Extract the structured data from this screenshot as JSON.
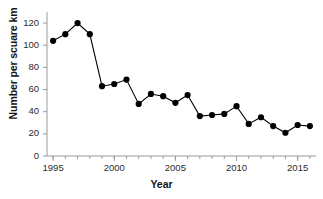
{
  "chart_data": {
    "type": "line",
    "title": "",
    "xlabel": "Year",
    "ylabel": "Number per scuare km",
    "x": [
      1995,
      1996,
      1997,
      1998,
      1999,
      2000,
      2001,
      2002,
      2003,
      2004,
      2005,
      2006,
      2007,
      2008,
      2009,
      2010,
      2011,
      2012,
      2013,
      2014,
      2015,
      2016
    ],
    "values": [
      104,
      110,
      120,
      110,
      63,
      65,
      69,
      47,
      56,
      54,
      48,
      55,
      36,
      37,
      38,
      45,
      29,
      35,
      27,
      21,
      28,
      27
    ],
    "series": [
      {
        "name": "Number per scuare km",
        "values": [
          104,
          110,
          120,
          110,
          63,
          65,
          69,
          47,
          56,
          54,
          48,
          55,
          36,
          37,
          38,
          45,
          29,
          35,
          27,
          21,
          28,
          27
        ]
      }
    ],
    "xlim": [
      1994.5,
      2016.5
    ],
    "ylim": [
      0,
      130
    ],
    "yticks": [
      0,
      20,
      40,
      60,
      80,
      100,
      120
    ],
    "ytick_labels": [
      "0",
      "20",
      "40",
      "60",
      "80",
      "100",
      "120"
    ],
    "xticks": [
      1995,
      2000,
      2005,
      2010,
      2015
    ],
    "xtick_labels": [
      "1995",
      "2000",
      "2005",
      "2010",
      "2015"
    ],
    "xminor_step": 1,
    "grid": false,
    "legend": false,
    "legend_position": "none",
    "marker": "circle",
    "marker_color": "#000000",
    "line_color": "#000000",
    "axis_color": "#808080",
    "background": "#ffffff"
  }
}
